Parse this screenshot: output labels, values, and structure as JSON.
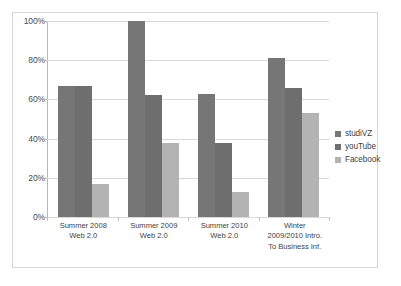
{
  "chart_data": {
    "type": "bar",
    "title": "",
    "subtitle": "",
    "xlabel": "",
    "ylabel": "",
    "ylim": [
      0,
      100
    ],
    "grid": true,
    "legend_position": "right",
    "categories": [
      "Summer 2008 Web 2.0",
      "Summer 2009 Web 2.0",
      "Summer 2010 Web 2.0",
      "Winter 2009/2010 Intro. To Business Inf."
    ],
    "category_lines": [
      [
        "Summer 2008",
        "Web 2.0"
      ],
      [
        "Summer 2009",
        "Web 2.0"
      ],
      [
        "Summer 2010",
        "Web 2.0"
      ],
      [
        "Winter",
        "2009/2010 Intro.",
        "To Business Inf."
      ]
    ],
    "series": [
      {
        "name": "studiVZ",
        "color": "#767676",
        "values": [
          67,
          100,
          63,
          81
        ]
      },
      {
        "name": "youTube",
        "color": "#6e6e6e",
        "values": [
          67,
          62,
          38,
          66
        ]
      },
      {
        "name": "Facebook",
        "color": "#b3b3b3",
        "values": [
          17,
          38,
          13,
          53
        ]
      }
    ],
    "y_ticks": [
      {
        "value": 100,
        "label": "100%"
      },
      {
        "value": 80,
        "label": "80%"
      },
      {
        "value": 60,
        "label": "60%"
      },
      {
        "value": 40,
        "label": "40%"
      },
      {
        "value": 20,
        "label": "20%"
      },
      {
        "value": 0,
        "label": "0%"
      }
    ]
  },
  "legend": {
    "items": [
      {
        "label": "studiVZ",
        "color": "#767676"
      },
      {
        "label": "youTube",
        "color": "#6e6e6e"
      },
      {
        "label": "Facebook",
        "color": "#b3b3b3"
      }
    ]
  },
  "colors": {
    "frame_border": "#d6d6d6",
    "gridline": "#d9d9d9",
    "axis": "#b8b8b8",
    "background": "#ffffff",
    "text": "#3a3a3a"
  }
}
